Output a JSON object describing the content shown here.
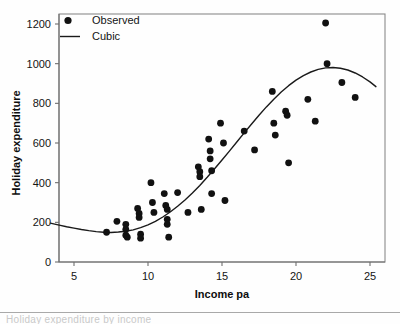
{
  "figure": {
    "background": "#fefefe",
    "ink_color": "#111111",
    "caption_fragment": "Holiday expenditure by income"
  },
  "chart_data": {
    "type": "scatter",
    "title": "",
    "xlabel": "Income pa",
    "ylabel": "Holiday expenditure",
    "xlim": [
      3.2,
      26.0
    ],
    "ylim": [
      -45,
      1255
    ],
    "xticks": [
      5,
      10,
      15,
      20,
      25
    ],
    "yticks": [
      0,
      200,
      400,
      600,
      800,
      1000,
      1200
    ],
    "grid": false,
    "legend_position": "top-left",
    "legend": [
      {
        "label": "Observed",
        "marker": "circle",
        "color": "#111111"
      },
      {
        "label": "Cubic",
        "marker": "line",
        "color": "#1a1a1a"
      }
    ],
    "series": [
      {
        "name": "Observed",
        "type": "scatter",
        "points": [
          [
            7.2,
            150
          ],
          [
            7.9,
            205
          ],
          [
            8.5,
            190
          ],
          [
            8.5,
            165
          ],
          [
            8.5,
            135
          ],
          [
            8.6,
            125
          ],
          [
            9.3,
            270
          ],
          [
            9.4,
            245
          ],
          [
            9.4,
            225
          ],
          [
            9.5,
            140
          ],
          [
            9.5,
            120
          ],
          [
            10.2,
            400
          ],
          [
            10.3,
            300
          ],
          [
            10.4,
            250
          ],
          [
            11.1,
            345
          ],
          [
            11.2,
            285
          ],
          [
            11.3,
            265
          ],
          [
            11.3,
            215
          ],
          [
            11.3,
            190
          ],
          [
            11.4,
            125
          ],
          [
            12.0,
            350
          ],
          [
            12.7,
            250
          ],
          [
            13.4,
            480
          ],
          [
            13.5,
            455
          ],
          [
            13.5,
            430
          ],
          [
            13.6,
            265
          ],
          [
            14.1,
            620
          ],
          [
            14.2,
            560
          ],
          [
            14.2,
            520
          ],
          [
            14.3,
            460
          ],
          [
            14.3,
            345
          ],
          [
            14.9,
            700
          ],
          [
            15.1,
            600
          ],
          [
            15.2,
            310
          ],
          [
            16.5,
            660
          ],
          [
            17.2,
            565
          ],
          [
            18.4,
            860
          ],
          [
            18.5,
            700
          ],
          [
            18.6,
            640
          ],
          [
            19.3,
            760
          ],
          [
            19.4,
            740
          ],
          [
            19.5,
            500
          ],
          [
            20.8,
            820
          ],
          [
            21.3,
            710
          ],
          [
            22.0,
            1205
          ],
          [
            22.1,
            1000
          ],
          [
            23.1,
            905
          ],
          [
            24.0,
            830
          ]
        ]
      },
      {
        "name": "Cubic",
        "type": "line",
        "points": [
          [
            3.4,
            196
          ],
          [
            4.0,
            186
          ],
          [
            4.5,
            178
          ],
          [
            5.0,
            171
          ],
          [
            5.5,
            164
          ],
          [
            6.0,
            158
          ],
          [
            6.5,
            153
          ],
          [
            7.0,
            150
          ],
          [
            7.5,
            149
          ],
          [
            8.0,
            151
          ],
          [
            8.5,
            155
          ],
          [
            9.0,
            162
          ],
          [
            9.5,
            173
          ],
          [
            10.0,
            187
          ],
          [
            10.5,
            205
          ],
          [
            11.0,
            227
          ],
          [
            11.5,
            252
          ],
          [
            12.0,
            281
          ],
          [
            12.5,
            313
          ],
          [
            13.0,
            348
          ],
          [
            13.5,
            386
          ],
          [
            14.0,
            427
          ],
          [
            14.5,
            470
          ],
          [
            15.0,
            514
          ],
          [
            15.5,
            559
          ],
          [
            16.0,
            605
          ],
          [
            16.5,
            651
          ],
          [
            17.0,
            696
          ],
          [
            17.5,
            740
          ],
          [
            18.0,
            782
          ],
          [
            18.5,
            821
          ],
          [
            19.0,
            857
          ],
          [
            19.5,
            889
          ],
          [
            20.0,
            917
          ],
          [
            20.5,
            940
          ],
          [
            21.0,
            958
          ],
          [
            21.5,
            971
          ],
          [
            22.0,
            979
          ],
          [
            22.5,
            981
          ],
          [
            23.0,
            977
          ],
          [
            23.5,
            968
          ],
          [
            24.0,
            953
          ],
          [
            24.5,
            933
          ],
          [
            25.0,
            908
          ],
          [
            25.4,
            884
          ]
        ]
      }
    ]
  }
}
